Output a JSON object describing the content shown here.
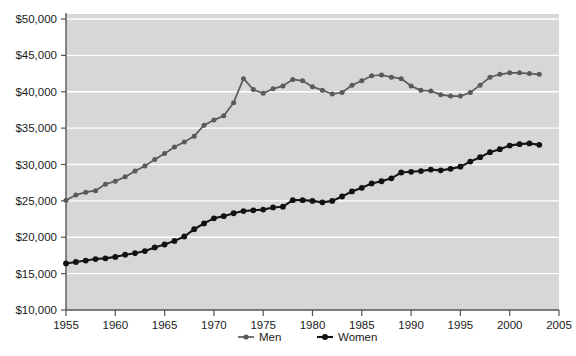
{
  "chart_data": {
    "type": "line",
    "title": "",
    "subtitle": "",
    "xlabel": "",
    "ylabel": "",
    "xlim": [
      1955,
      2005
    ],
    "ylim": [
      10000,
      50000
    ],
    "x_ticks": [
      1955,
      1960,
      1965,
      1970,
      1975,
      1980,
      1985,
      1990,
      1995,
      2000,
      2005
    ],
    "x_tick_labels": [
      "1955",
      "1960",
      "1965",
      "1970",
      "1975",
      "1980",
      "1985",
      "1990",
      "1995",
      "2000",
      "2005"
    ],
    "y_ticks": [
      10000,
      15000,
      20000,
      25000,
      30000,
      35000,
      40000,
      45000,
      50000
    ],
    "y_tick_labels": [
      "$10,000",
      "$15,000",
      "$20,000",
      "$25,000",
      "$30,000",
      "$35,000",
      "$40,000",
      "$45,000",
      "$50,000"
    ],
    "grid": "horizontal",
    "legend_position": "bottom",
    "plot_background": "#d7d7d7",
    "x": [
      1955,
      1956,
      1957,
      1958,
      1959,
      1960,
      1961,
      1962,
      1963,
      1964,
      1965,
      1966,
      1967,
      1968,
      1969,
      1970,
      1971,
      1972,
      1973,
      1974,
      1975,
      1976,
      1977,
      1978,
      1979,
      1980,
      1981,
      1982,
      1983,
      1984,
      1985,
      1986,
      1987,
      1988,
      1989,
      1990,
      1991,
      1992,
      1993,
      1994,
      1995,
      1996,
      1997,
      1998,
      1999,
      2000,
      2001,
      2002,
      2003
    ],
    "series": [
      {
        "name": "Men",
        "color": "#5a5a5a",
        "values": [
          25100,
          25800,
          26200,
          26400,
          27300,
          27700,
          28300,
          29100,
          29800,
          30700,
          31500,
          32400,
          33100,
          33900,
          35400,
          36100,
          36700,
          38500,
          41800,
          40300,
          39800,
          40400,
          40800,
          41700,
          41500,
          40700,
          40200,
          39700,
          39900,
          40900,
          41500,
          42200,
          42300,
          42000,
          41800,
          40800,
          40200,
          40100,
          39600,
          39400,
          39400,
          39900,
          40900,
          42000,
          42400,
          42600,
          42600,
          42500,
          42400
        ]
      },
      {
        "name": "Women",
        "color": "#121212",
        "values": [
          16400,
          16600,
          16800,
          17000,
          17100,
          17300,
          17600,
          17800,
          18100,
          18600,
          19000,
          19500,
          20100,
          21100,
          21900,
          22600,
          22900,
          23300,
          23600,
          23700,
          23800,
          24100,
          24200,
          25100,
          25100,
          25000,
          24800,
          25000,
          25600,
          26300,
          26800,
          27400,
          27700,
          28100,
          28900,
          29000,
          29100,
          29300,
          29200,
          29400,
          29700,
          30400,
          31000,
          31700,
          32100,
          32600,
          32800,
          32900,
          32700
        ]
      }
    ]
  },
  "axes": {
    "x_axis_name": "year-axis",
    "y_axis_name": "earnings-axis"
  },
  "legend": {
    "items": [
      {
        "label": "Men",
        "marker_color": "#5a5a5a"
      },
      {
        "label": "Women",
        "marker_color": "#121212"
      }
    ]
  }
}
